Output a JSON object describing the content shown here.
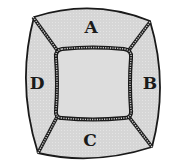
{
  "diagram": {
    "colors": {
      "fill": "#d9d9d9",
      "inner_fill": "#dcdcdc",
      "stroke": "#1a1a1a",
      "background": "#ffffff"
    },
    "regions": [
      {
        "id": "A",
        "label": "A",
        "position": "top"
      },
      {
        "id": "B",
        "label": "B",
        "position": "right"
      },
      {
        "id": "C",
        "label": "C",
        "position": "bottom"
      },
      {
        "id": "D",
        "label": "D",
        "position": "left"
      }
    ],
    "center": {
      "label": ""
    }
  }
}
